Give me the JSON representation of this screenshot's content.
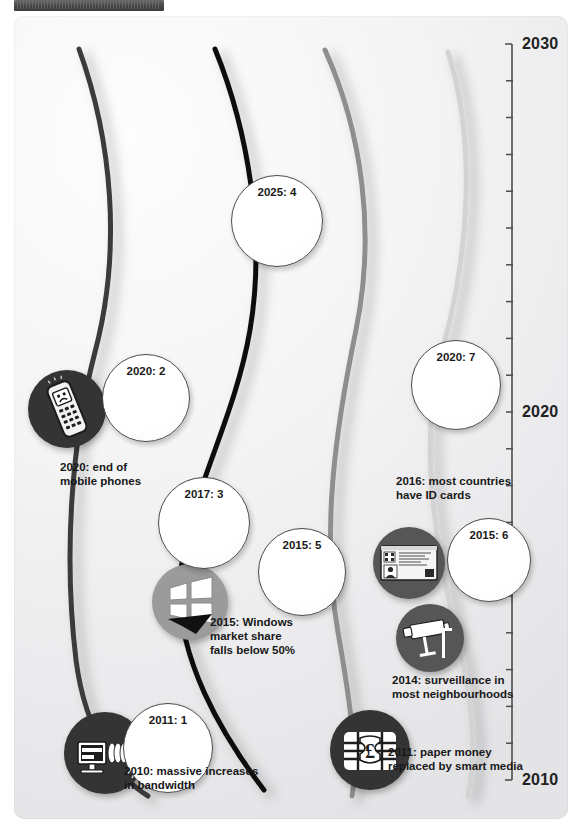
{
  "window": {
    "title_bar": ""
  },
  "axis": {
    "name": "year-axis",
    "top_year": "2030",
    "mid_year": "2020",
    "bottom_year": "2010",
    "range": [
      2010,
      2030
    ],
    "tick_interval": 1,
    "labels": [
      {
        "text": "2030",
        "year": 2030,
        "y": 44
      },
      {
        "text": "2020",
        "year": 2020,
        "y": 412
      },
      {
        "text": "2010",
        "year": 2010,
        "y": 780
      }
    ]
  },
  "bubbles": [
    {
      "name": "bubble-2025-4",
      "label": "2025: 4",
      "year": 2025,
      "value": 4,
      "x": 231,
      "y": 175,
      "size": 92
    },
    {
      "name": "bubble-2020-2",
      "label": "2020: 2",
      "year": 2020,
      "value": 2,
      "x": 102,
      "y": 354,
      "size": 88
    },
    {
      "name": "bubble-2020-7",
      "label": "2020: 7",
      "year": 2020,
      "value": 7,
      "x": 411,
      "y": 340,
      "size": 90
    },
    {
      "name": "bubble-2017-3",
      "label": "2017: 3",
      "year": 2017,
      "value": 3,
      "x": 158,
      "y": 477,
      "size": 92
    },
    {
      "name": "bubble-2015-5",
      "label": "2015: 5",
      "year": 2015,
      "value": 5,
      "x": 258,
      "y": 528,
      "size": 88
    },
    {
      "name": "bubble-2015-6",
      "label": "2015: 6",
      "year": 2015,
      "value": 6,
      "x": 447,
      "y": 518,
      "size": 84
    },
    {
      "name": "bubble-2011-1",
      "label": "2011: 1",
      "year": 2011,
      "value": 1,
      "x": 123,
      "y": 703,
      "size": 90
    }
  ],
  "events": [
    {
      "name": "event-mobile-phones",
      "icon": "mobile-phone-icon",
      "caption": "2020: end of\nmobile phones",
      "year": 2020,
      "disc": {
        "x": 28,
        "y": 370,
        "size": 78,
        "shade": "disc-dark"
      },
      "caption_pos": {
        "x": 60,
        "y": 460
      }
    },
    {
      "name": "event-windows-market-share",
      "icon": "windows-logo-icon",
      "caption": "2015: Windows\nmarket share\nfalls below 50%",
      "year": 2015,
      "disc": {
        "x": 152,
        "y": 564,
        "size": 76,
        "shade": "disc-gray"
      },
      "caption_pos": {
        "x": 210,
        "y": 615
      }
    },
    {
      "name": "event-id-cards",
      "icon": "id-card-icon",
      "caption": "2016: most countries\nhave ID cards",
      "year": 2016,
      "disc": {
        "x": 373,
        "y": 527,
        "size": 72,
        "shade": "disc-mid"
      },
      "caption_pos": {
        "x": 396,
        "y": 474
      }
    },
    {
      "name": "event-surveillance",
      "icon": "cctv-camera-icon",
      "caption": "2014: surveillance in\nmost neighbourhoods",
      "year": 2014,
      "disc": {
        "x": 396,
        "y": 604,
        "size": 68,
        "shade": "disc-mid"
      },
      "caption_pos": {
        "x": 392,
        "y": 673
      }
    },
    {
      "name": "event-smart-media-money",
      "icon": "smart-card-chip-icon",
      "caption": "2011: paper money\nreplaced by smart media",
      "year": 2011,
      "disc": {
        "x": 330,
        "y": 710,
        "size": 80,
        "shade": "disc-dark"
      },
      "caption_pos": {
        "x": 388,
        "y": 745
      }
    }
  ],
  "curves": [
    {
      "name": "trend-curve-1",
      "color": "#3a3a3a",
      "width": 5
    },
    {
      "name": "trend-curve-2",
      "color": "#111111",
      "width": 5
    },
    {
      "name": "trend-curve-3",
      "color": "#8e8e8e",
      "width": 5
    },
    {
      "name": "trend-curve-4",
      "color": "#d3d3d3",
      "width": 5
    }
  ],
  "colors": {
    "panel_background": "#f1f1f3",
    "axis_line": "#4d4d4d",
    "text": "#181818",
    "bubble_fill": "#ffffff",
    "bubble_border": "#4a4a4a"
  }
}
